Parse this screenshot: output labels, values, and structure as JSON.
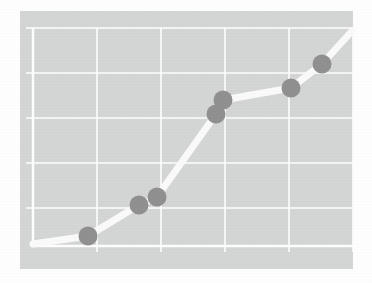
{
  "figure": {
    "title": "",
    "subtitle": "",
    "width": 372,
    "height": 283,
    "background_color": "#ffffff",
    "panel": {
      "x": 20,
      "y": 11,
      "width": 333,
      "height": 258,
      "fill_color": "#d5d7d6"
    }
  },
  "style": {
    "grid_color": "#ffffff",
    "grid_width": 1.6,
    "axis_color": "#ffffff",
    "axis_width": 2.4,
    "line_color": "#fbfbfb",
    "line_width": 7,
    "marker_color": "#919191",
    "marker_radius": 9.5
  },
  "chart_data": {
    "type": "line",
    "title": "",
    "xlabel": "",
    "ylabel": "",
    "grid": true,
    "legend": "none",
    "xlim": [
      0,
      5
    ],
    "ylim": [
      0,
      5
    ],
    "xticks": [
      0,
      1,
      2,
      3,
      4,
      5
    ],
    "yticks": [
      0,
      1,
      2,
      3,
      4,
      5
    ],
    "xtick_labels": [
      "",
      "",
      "",
      "",
      "",
      ""
    ],
    "ytick_labels": [
      "",
      "",
      "",
      "",
      "",
      ""
    ],
    "x_gridline_px": [
      33,
      97,
      161,
      225,
      289,
      353
    ],
    "y_gridline_px": [
      28,
      73,
      118,
      163,
      208,
      246
    ],
    "series": [
      {
        "name": "series-1",
        "x": [
          0.0,
          0.86,
          1.66,
          1.94,
          2.86,
          2.97,
          4.03,
          4.52,
          5.0
        ],
        "y": [
          0.05,
          0.23,
          0.92,
          1.09,
          2.93,
          3.22,
          3.51,
          4.04,
          4.78
        ],
        "points_px": [
          {
            "x": 33,
            "y": 244
          },
          {
            "x": 88,
            "y": 236
          },
          {
            "x": 139,
            "y": 205
          },
          {
            "x": 157,
            "y": 197
          },
          {
            "x": 216,
            "y": 114
          },
          {
            "x": 223,
            "y": 100
          },
          {
            "x": 291,
            "y": 88
          },
          {
            "x": 322,
            "y": 64
          },
          {
            "x": 352,
            "y": 31
          }
        ]
      }
    ],
    "markers": [
      {
        "label": "point-1",
        "x_px": 88,
        "y_px": 236,
        "x": 0.86,
        "y": 0.23
      },
      {
        "label": "point-2",
        "x_px": 139,
        "y_px": 205,
        "x": 1.66,
        "y": 0.92
      },
      {
        "label": "point-3",
        "x_px": 157,
        "y_px": 197,
        "x": 1.94,
        "y": 1.09
      },
      {
        "label": "point-4",
        "x_px": 216,
        "y_px": 114,
        "x": 2.86,
        "y": 2.93
      },
      {
        "label": "point-5",
        "x_px": 223,
        "y_px": 100,
        "x": 2.97,
        "y": 3.22
      },
      {
        "label": "point-6",
        "x_px": 291,
        "y_px": 88,
        "x": 4.03,
        "y": 3.51
      },
      {
        "label": "point-7",
        "x_px": 322,
        "y_px": 64,
        "x": 4.52,
        "y": 4.04
      }
    ]
  }
}
